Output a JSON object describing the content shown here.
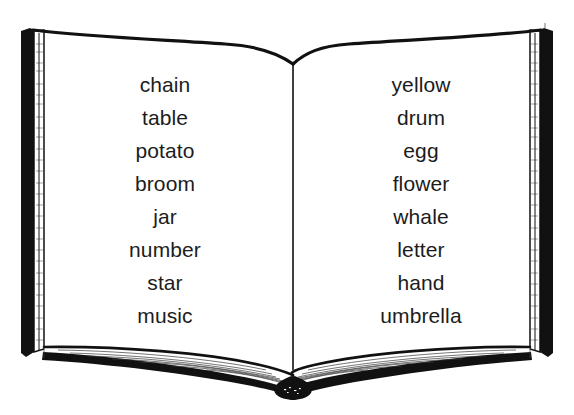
{
  "illustration": {
    "name": "open-book-with-word-lists",
    "subject": "open book",
    "background_color": "#ffffff",
    "ink_color": "#111111",
    "text_color": "#1c1c1c",
    "style": "black-and-white line drawing"
  },
  "book": {
    "left_page": {
      "label": "left page",
      "words": [
        "chain",
        "table",
        "potato",
        "broom",
        "jar",
        "number",
        "star",
        "music"
      ]
    },
    "right_page": {
      "label": "right page",
      "words": [
        "yellow",
        "drum",
        "egg",
        "flower",
        "whale",
        "letter",
        "hand",
        "umbrella"
      ]
    }
  }
}
